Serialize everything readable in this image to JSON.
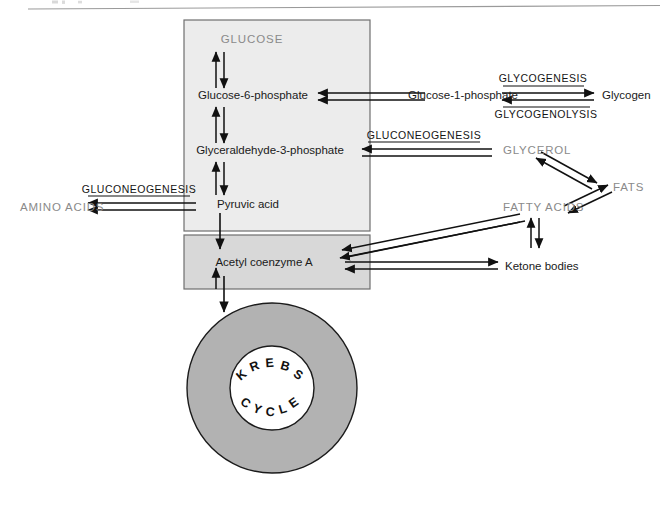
{
  "figure": {
    "top_rule": true,
    "background_color": "#ffffff"
  },
  "colors": {
    "glycolysis_box_fill": "#ececec",
    "acetyl_box_fill": "#d8d8d8",
    "box_border": "#6f6f6f",
    "krebs_ring_fill": "#b2b2b2",
    "krebs_ring_border": "#1b1b1b",
    "arrow_color": "#111111",
    "gray_text": "#8a8a8a",
    "dark_text": "#1a1a1a",
    "rule_color": "#9a9a9a"
  },
  "boxes": {
    "glycolysis": {
      "name": "glycolysis-pathway-box"
    },
    "acetyl": {
      "name": "acetyl-coa-box"
    }
  },
  "nodes": {
    "glucose": "GLUCOSE",
    "glucose_6_phosphate": "Glucose-6-phosphate",
    "glyceraldehyde_3_phosphate": "Glyceraldehyde-3-phosphate",
    "pyruvic_acid": "Pyruvic acid",
    "acetyl_coenzyme_a": "Acetyl coenzyme A",
    "glucose_1_phosphate": "Glucose-1-phosphate",
    "glycogen": "Glycogen",
    "glycerol": "GLYCEROL",
    "fats": "FATS",
    "fatty_acids": "FATTY ACIDS",
    "ketone_bodies": "Ketone bodies",
    "amino_acids": "AMINO ACIDS"
  },
  "process_labels": {
    "glycogenesis": "GLYCOGENESIS",
    "glycogenolysis": "GLYCOGENOLYSIS",
    "gluconeogenesis_upper": "GLUCONEOGENESIS",
    "gluconeogenesis_lower": "GLUCONEOGENESIS"
  },
  "krebs": {
    "top_word": "KREBS",
    "bottom_word": "CYCLE",
    "top_letters": [
      "K",
      "R",
      "E",
      "B",
      "S"
    ],
    "bottom_letters": [
      "C",
      "Y",
      "C",
      "L",
      "E"
    ]
  },
  "arrows": [
    {
      "id": "glucose-g6p",
      "from": "GLUCOSE",
      "to": "Glucose-6-phosphate",
      "type": "bidirectional",
      "orientation": "vertical"
    },
    {
      "id": "g6p-g3p",
      "from": "Glucose-6-phosphate",
      "to": "Glyceraldehyde-3-phosphate",
      "type": "bidirectional",
      "orientation": "vertical"
    },
    {
      "id": "g3p-pyruvate",
      "from": "Glyceraldehyde-3-phosphate",
      "to": "Pyruvic acid",
      "type": "bidirectional",
      "orientation": "vertical"
    },
    {
      "id": "pyruvate-acetyl",
      "from": "Pyruvic acid",
      "to": "Acetyl coenzyme A",
      "type": "unidirectional",
      "orientation": "vertical"
    },
    {
      "id": "acetyl-krebs",
      "from": "Acetyl coenzyme A",
      "to": "KREBS CYCLE",
      "type": "unidirectional",
      "orientation": "vertical"
    },
    {
      "id": "g6p-g1p",
      "from": "Glucose-6-phosphate",
      "to": "Glucose-1-phosphate",
      "type": "bidirectional",
      "orientation": "horizontal"
    },
    {
      "id": "g1p-glycogen",
      "from": "Glucose-1-phosphate",
      "to": "Glycogen",
      "type": "bidirectional",
      "orientation": "horizontal",
      "labels": [
        "GLYCOGENESIS",
        "GLYCOGENOLYSIS"
      ]
    },
    {
      "id": "glycerol-g3p",
      "from": "GLYCEROL",
      "to": "Glyceraldehyde-3-phosphate",
      "type": "bidirectional",
      "orientation": "horizontal",
      "labels": [
        "GLUCONEOGENESIS"
      ]
    },
    {
      "id": "pyruvate-amino",
      "from": "Pyruvic acid",
      "to": "AMINO ACIDS",
      "type": "bidirectional",
      "orientation": "horizontal",
      "labels": [
        "GLUCONEOGENESIS"
      ]
    },
    {
      "id": "glycerol-fats",
      "from": "GLYCEROL",
      "to": "FATS",
      "type": "bidirectional",
      "orientation": "diagonal"
    },
    {
      "id": "fats-fatty-acids",
      "from": "FATS",
      "to": "FATTY ACIDS",
      "type": "bidirectional",
      "orientation": "diagonal"
    },
    {
      "id": "fatty-acids-acetyl",
      "from": "FATTY ACIDS",
      "to": "Acetyl coenzyme A",
      "type": "bidirectional",
      "orientation": "diagonal"
    },
    {
      "id": "acetyl-ketone",
      "from": "Acetyl coenzyme A",
      "to": "Ketone bodies",
      "type": "bidirectional",
      "orientation": "horizontal"
    },
    {
      "id": "fatty-acids-ketone",
      "from": "FATTY ACIDS",
      "to": "Ketone bodies",
      "type": "bidirectional",
      "orientation": "vertical"
    }
  ]
}
